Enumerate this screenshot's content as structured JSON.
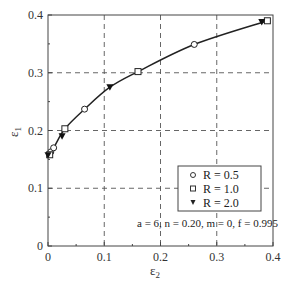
{
  "chart_data": {
    "type": "line",
    "title": "",
    "xlabel": "ε2",
    "ylabel": "ε1",
    "xlim": [
      0,
      0.4
    ],
    "ylim": [
      0,
      0.4
    ],
    "xticks": [
      "0",
      "0.1",
      "0.2",
      "0.3",
      "0.4"
    ],
    "yticks": [
      "0",
      "0.1",
      "0.2",
      "0.3",
      "0.4"
    ],
    "grid": true,
    "legend_position": "lower right",
    "series": [
      {
        "name": "R = 0.5",
        "marker": "circle",
        "x": [
          0.005,
          0.01,
          0.065,
          0.26
        ],
        "y": [
          0.163,
          0.17,
          0.237,
          0.349
        ]
      },
      {
        "name": "R = 1.0",
        "marker": "square",
        "x": [
          0.003,
          0.03,
          0.16,
          0.39
        ],
        "y": [
          0.158,
          0.203,
          0.302,
          0.39
        ]
      },
      {
        "name": "R = 2.0",
        "marker": "triangle-down",
        "x": [
          0.0,
          0.025,
          0.11,
          0.38
        ],
        "y": [
          0.157,
          0.19,
          0.275,
          0.388
        ]
      }
    ],
    "curve": {
      "x": [
        0,
        0.01,
        0.03,
        0.065,
        0.11,
        0.16,
        0.26,
        0.39
      ],
      "y": [
        0.157,
        0.17,
        0.203,
        0.237,
        0.275,
        0.302,
        0.349,
        0.39
      ]
    },
    "annotations": [
      "a = 6, n = 0.20, m = 0, f = 0.995"
    ]
  },
  "axes": {
    "xlabel_main": "ε",
    "xlabel_sub": "2",
    "ylabel_main": "ε",
    "ylabel_sub": "1"
  },
  "legend": {
    "items": [
      {
        "label": "R = 0.5",
        "marker": "circle"
      },
      {
        "label": "R = 1.0",
        "marker": "square"
      },
      {
        "label": "R = 2.0",
        "marker": "triangle-down"
      }
    ]
  },
  "annotation": "a = 6, n = 0.20, m = 0, f = 0.995"
}
